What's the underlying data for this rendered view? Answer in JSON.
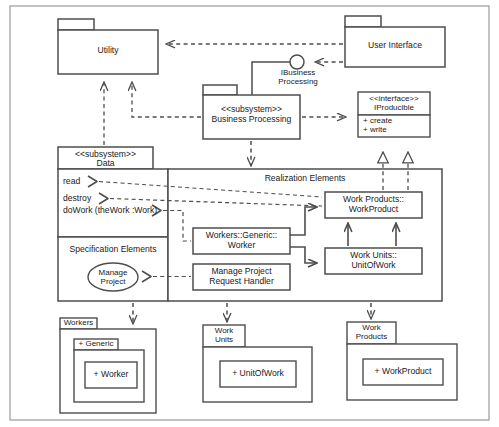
{
  "diagram": {
    "notation": "UML",
    "stroke_color": "#4d4d4d",
    "frame_color": "#808080",
    "background": "#ffffff",
    "text_color": "#1a1a1a"
  },
  "packages": {
    "utility": {
      "label": "Utility"
    },
    "user_interface": {
      "label": "User Interface"
    },
    "business_processing": {
      "stereotype": "<<subsystem>>",
      "label": "Business Processing"
    },
    "data": {
      "stereotype": "<<subsystem>>",
      "label": "Data"
    },
    "workers": {
      "label": "Workers",
      "child": {
        "label": "+ Generic",
        "child": {
          "label": "+ Worker"
        }
      }
    },
    "work_units": {
      "label": "Work\nUnits",
      "child": {
        "label": "+ UnitOfWork"
      }
    },
    "work_products": {
      "label": "Work\nProducts",
      "child": {
        "label": "+ WorkProduct"
      }
    }
  },
  "interfaces": {
    "ibusiness_processing": {
      "label": "IBusiness\nProcessing"
    },
    "iproducible": {
      "stereotype": "<<interface>>",
      "label": "IProducible",
      "operations": [
        "+ create",
        "+ write"
      ]
    }
  },
  "data_compartments": {
    "operations": [
      {
        "label": "read"
      },
      {
        "label": "destroy"
      },
      {
        "label": "doWork (theWork :Work)"
      }
    ],
    "specification_elements": {
      "label": "Specification Elements",
      "use_case": {
        "label": "Manage\nProject"
      }
    }
  },
  "realization_elements": {
    "label": "Realization Elements",
    "classes": [
      {
        "name": "worker",
        "label": "Workers::Generic::\nWorker"
      },
      {
        "name": "work-product",
        "label": "Work Products::\nWorkProduct"
      },
      {
        "name": "unit-of-work",
        "label": "Work Units::\nUnitOfWork"
      },
      {
        "name": "manage-project-request-handler",
        "label": "Manage Project\nRequest Handler"
      }
    ]
  }
}
